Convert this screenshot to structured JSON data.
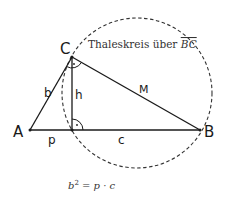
{
  "diagram": {
    "type": "geometry",
    "points": {
      "A": {
        "label": "A",
        "x": 30,
        "y": 130
      },
      "B": {
        "label": "B",
        "x": 200,
        "y": 130
      },
      "C": {
        "label": "C",
        "x": 72,
        "y": 57
      },
      "F": {
        "label": "",
        "x": 72,
        "y": 130
      }
    },
    "segment_labels": {
      "b": "b",
      "h": "h",
      "p": "p",
      "c": "c",
      "M": "M"
    },
    "circle": {
      "label": "Thaleskreis über BC",
      "label_text": "Thaleskreis über ",
      "label_math": "BC",
      "cx": 137,
      "cy": 93,
      "r": 75,
      "style": "dashed"
    },
    "formula": "b² = p · c",
    "formula_parts": {
      "lhs": "b",
      "exp": "2",
      "eq": " = p · c"
    },
    "colors": {
      "line": "#1a1a1a",
      "dashed": "#333333",
      "background": "#ffffff"
    }
  }
}
